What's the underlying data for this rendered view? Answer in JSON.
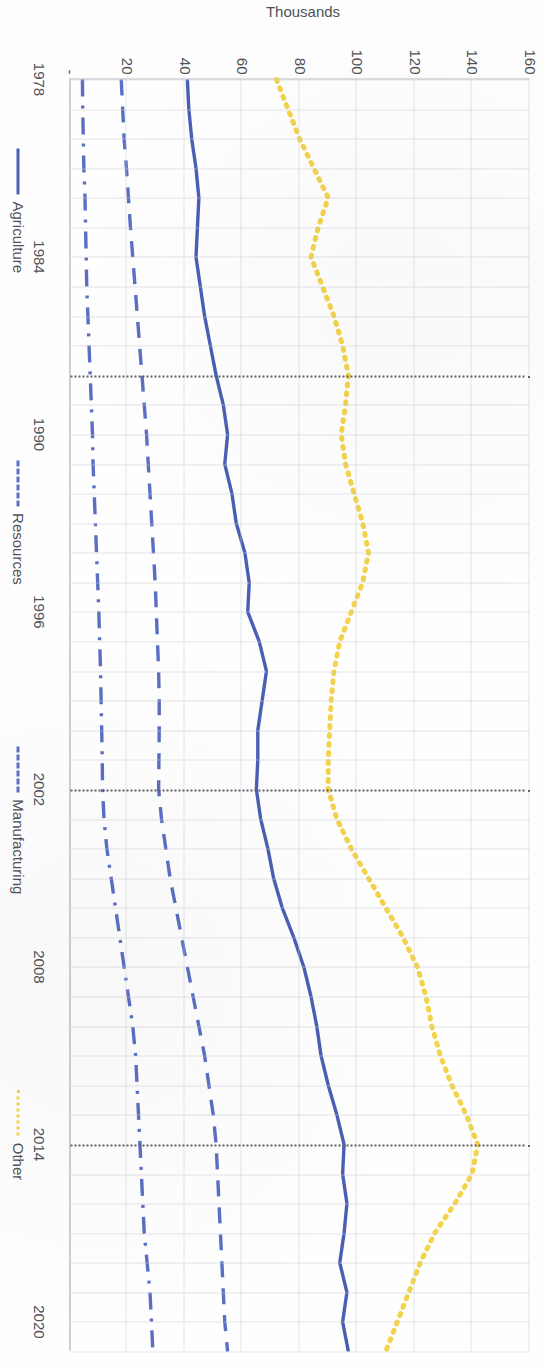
{
  "chart_data": {
    "type": "line",
    "title": "",
    "xlabel": "",
    "ylabel": "Thousands",
    "x": [
      1978,
      1979,
      1980,
      1981,
      1982,
      1983,
      1984,
      1985,
      1986,
      1987,
      1988,
      1989,
      1990,
      1991,
      1992,
      1993,
      1994,
      1995,
      1996,
      1997,
      1998,
      1999,
      2000,
      2001,
      2002,
      2003,
      2004,
      2005,
      2006,
      2007,
      2008,
      2009,
      2010,
      2011,
      2012,
      2013,
      2014,
      2015,
      2016,
      2017,
      2018,
      2019,
      2020,
      2021
    ],
    "xtick_labels": [
      "1978",
      "1984",
      "1990",
      "1996",
      "2002",
      "2008",
      "2014",
      "2020"
    ],
    "xticks": [
      1978,
      1984,
      1990,
      1996,
      2002,
      2008,
      2014,
      2020
    ],
    "ytick_labels": [
      "-",
      "20",
      "40",
      "60",
      "80",
      "100",
      "120",
      "140",
      "160"
    ],
    "yticks": [
      0,
      20,
      40,
      60,
      80,
      100,
      120,
      140,
      160
    ],
    "ylim": [
      0,
      160
    ],
    "xlim": [
      1978,
      2021
    ],
    "grid": true,
    "legend_position": "bottom",
    "series": [
      {
        "name": "Agriculture",
        "style": "solid",
        "color": "#4a5fb4",
        "values": [
          41,
          41.5,
          42.5,
          44,
          45,
          44.5,
          44,
          45.5,
          47,
          49,
          51,
          53.5,
          55,
          54,
          56.5,
          58,
          61,
          62.5,
          62,
          66,
          68.5,
          67,
          65.5,
          65.5,
          65,
          66.5,
          69,
          71,
          74,
          78,
          81.5,
          84,
          86,
          87.5,
          90,
          93,
          95.5,
          95,
          96.5,
          95.5,
          94,
          96.5,
          95,
          97
        ]
      },
      {
        "name": "Resources",
        "style": "dashdot",
        "color": "#5a6fc4",
        "values": [
          4.5,
          4.6,
          4.8,
          5,
          5.4,
          5.6,
          5.8,
          6,
          6.4,
          6.8,
          7.2,
          7.6,
          8,
          8.2,
          8.6,
          9,
          9.4,
          9.8,
          10.2,
          10.5,
          10.8,
          11,
          11.2,
          11.4,
          11.5,
          12,
          13,
          14.5,
          16,
          17.5,
          19,
          20.5,
          22,
          23,
          23.5,
          24,
          24.5,
          25,
          25.5,
          26,
          27,
          28,
          28.5,
          29
        ]
      },
      {
        "name": "Manufacturing",
        "style": "dashed",
        "color": "#5a6fc4",
        "values": [
          18,
          18.5,
          19,
          19.8,
          20.5,
          21.2,
          22,
          22.8,
          23.6,
          24.4,
          25.2,
          26,
          26.8,
          27.4,
          28,
          28.6,
          29.2,
          29.8,
          30.2,
          30.6,
          31,
          31.2,
          31.2,
          31.1,
          31,
          32,
          33.5,
          35,
          37,
          39,
          41,
          43,
          45,
          47,
          48.5,
          50,
          51,
          51.5,
          52,
          52.5,
          53,
          53.5,
          54,
          55
        ]
      },
      {
        "name": "Other",
        "style": "dotted",
        "color": "#f3d34a",
        "values": [
          72,
          76,
          80,
          85,
          90,
          86.5,
          84,
          88,
          92,
          95,
          97,
          96,
          94.5,
          96,
          99,
          102,
          104,
          102,
          98,
          94,
          92,
          91,
          90.5,
          90,
          90,
          93,
          98,
          104,
          110,
          116,
          121,
          124,
          126,
          129,
          133,
          138,
          142,
          140,
          134,
          127,
          122,
          118,
          114,
          110
        ]
      }
    ]
  },
  "axis": {
    "y_title": "Thousands"
  },
  "legend": {
    "items": [
      {
        "label": "Agriculture",
        "swatch": "solid-line-swatch"
      },
      {
        "label": "Resources",
        "swatch": "dashdot-line-swatch"
      },
      {
        "label": "Manufacturing",
        "swatch": "dashed-line-swatch"
      },
      {
        "label": "Other",
        "swatch": "dotted-line-swatch"
      }
    ]
  }
}
